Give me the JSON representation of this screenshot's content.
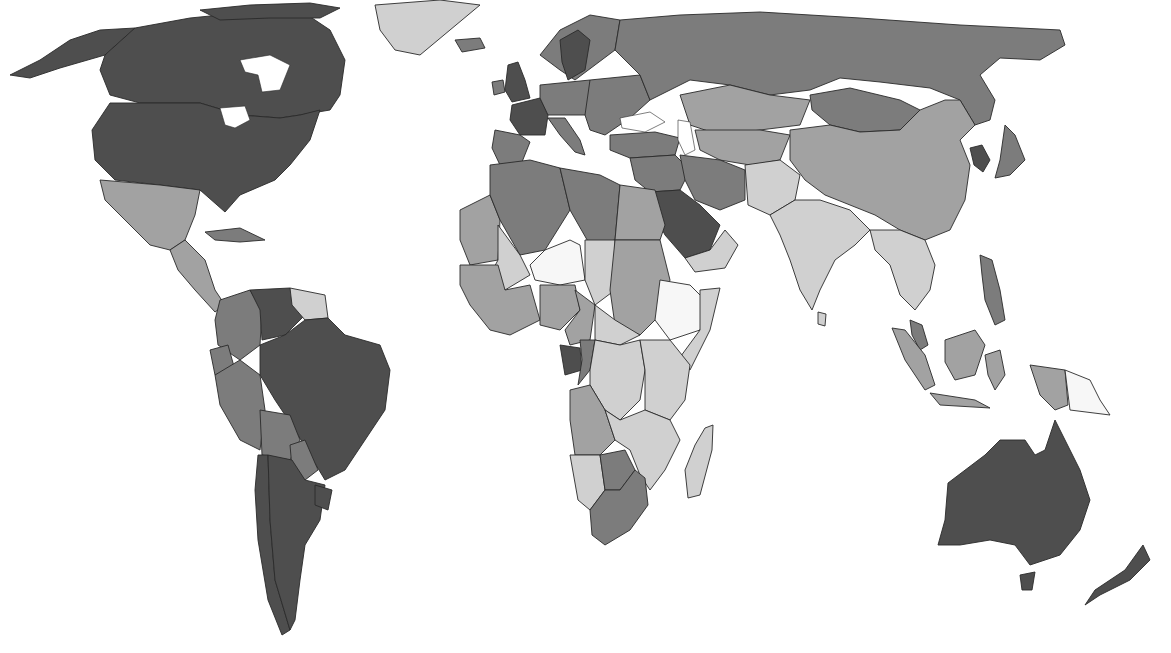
{
  "map": {
    "type": "choropleth",
    "projection": "world, equirectangular-like",
    "color_scheme": "grayscale",
    "legend_visible": false,
    "title": "",
    "classes": [
      {
        "id": "c1",
        "shade": "#f7f7f7",
        "rank": 1
      },
      {
        "id": "c2",
        "shade": "#d0d0d0",
        "rank": 2
      },
      {
        "id": "c3",
        "shade": "#a2a2a2",
        "rank": 3
      },
      {
        "id": "c4",
        "shade": "#7c7c7c",
        "rank": 4
      },
      {
        "id": "c5",
        "shade": "#4e4e4e",
        "rank": 5
      }
    ],
    "regions": [
      {
        "name": "Canada",
        "class": "c5"
      },
      {
        "name": "United States",
        "class": "c5"
      },
      {
        "name": "Alaska",
        "class": "c5"
      },
      {
        "name": "Greenland",
        "class": "c2"
      },
      {
        "name": "Mexico",
        "class": "c3"
      },
      {
        "name": "Central America",
        "class": "c3"
      },
      {
        "name": "Cuba",
        "class": "c4"
      },
      {
        "name": "Venezuela",
        "class": "c5"
      },
      {
        "name": "Colombia",
        "class": "c4"
      },
      {
        "name": "Guianas",
        "class": "c2"
      },
      {
        "name": "Ecuador",
        "class": "c4"
      },
      {
        "name": "Peru",
        "class": "c4"
      },
      {
        "name": "Brazil",
        "class": "c5"
      },
      {
        "name": "Bolivia",
        "class": "c4"
      },
      {
        "name": "Paraguay",
        "class": "c4"
      },
      {
        "name": "Chile",
        "class": "c5"
      },
      {
        "name": "Argentina",
        "class": "c5"
      },
      {
        "name": "Uruguay",
        "class": "c5"
      },
      {
        "name": "Iceland",
        "class": "c4"
      },
      {
        "name": "United Kingdom",
        "class": "c5"
      },
      {
        "name": "Ireland",
        "class": "c4"
      },
      {
        "name": "France",
        "class": "c5"
      },
      {
        "name": "Iberia",
        "class": "c4"
      },
      {
        "name": "Scandinavia",
        "class": "c4"
      },
      {
        "name": "Sweden",
        "class": "c5"
      },
      {
        "name": "Central Europe",
        "class": "c4"
      },
      {
        "name": "Eastern Europe",
        "class": "c4"
      },
      {
        "name": "Italy",
        "class": "c4"
      },
      {
        "name": "Turkey",
        "class": "c4"
      },
      {
        "name": "Russia",
        "class": "c4"
      },
      {
        "name": "Kazakhstan",
        "class": "c3"
      },
      {
        "name": "Central Asia",
        "class": "c3"
      },
      {
        "name": "Mongolia",
        "class": "c4"
      },
      {
        "name": "China",
        "class": "c3"
      },
      {
        "name": "Korea",
        "class": "c5"
      },
      {
        "name": "Japan",
        "class": "c4"
      },
      {
        "name": "Middle East",
        "class": "c4"
      },
      {
        "name": "Iran",
        "class": "c4"
      },
      {
        "name": "Saudi Arabia",
        "class": "c5"
      },
      {
        "name": "Yemen/Oman",
        "class": "c2"
      },
      {
        "name": "Afghanistan/Pakistan",
        "class": "c2"
      },
      {
        "name": "India",
        "class": "c2"
      },
      {
        "name": "Southeast Asia",
        "class": "c2"
      },
      {
        "name": "Malaysia",
        "class": "c4"
      },
      {
        "name": "Indonesia",
        "class": "c3"
      },
      {
        "name": "Papua New Guinea",
        "class": "c1"
      },
      {
        "name": "Philippines",
        "class": "c4"
      },
      {
        "name": "Australia",
        "class": "c5"
      },
      {
        "name": "New Zealand",
        "class": "c5"
      },
      {
        "name": "North Africa (Algeria/Libya)",
        "class": "c4"
      },
      {
        "name": "Egypt",
        "class": "c3"
      },
      {
        "name": "Western Sahara/Mauritania",
        "class": "c3"
      },
      {
        "name": "Mali",
        "class": "c2"
      },
      {
        "name": "Niger",
        "class": "c1"
      },
      {
        "name": "Chad",
        "class": "c2"
      },
      {
        "name": "Sudan",
        "class": "c3"
      },
      {
        "name": "Ethiopia",
        "class": "c1"
      },
      {
        "name": "Somalia",
        "class": "c2"
      },
      {
        "name": "West Africa",
        "class": "c3"
      },
      {
        "name": "Nigeria",
        "class": "c3"
      },
      {
        "name": "Gabon",
        "class": "c5"
      },
      {
        "name": "Congo",
        "class": "c4"
      },
      {
        "name": "DR Congo",
        "class": "c2"
      },
      {
        "name": "East Africa",
        "class": "c2"
      },
      {
        "name": "Angola",
        "class": "c3"
      },
      {
        "name": "Zambia/Mozambique",
        "class": "c2"
      },
      {
        "name": "Namibia",
        "class": "c2"
      },
      {
        "name": "Botswana",
        "class": "c4"
      },
      {
        "name": "South Africa",
        "class": "c4"
      },
      {
        "name": "Madagascar",
        "class": "c2"
      }
    ]
  }
}
